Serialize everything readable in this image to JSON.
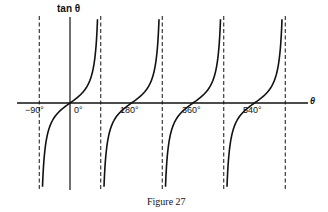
{
  "figure": {
    "y_axis_label": "tan θ",
    "x_axis_label": "θ",
    "caption": "Figure 27",
    "tick_labels": [
      "−90°",
      "0°",
      "180°",
      "360°",
      "540°"
    ],
    "line_color": "#111111"
  },
  "chart_data": {
    "type": "line",
    "title": "",
    "xlabel": "θ",
    "ylabel": "tan θ",
    "function": "tan(θ)",
    "xlim_deg": [
      -110,
      650
    ],
    "x_ticks_deg": [
      -90,
      0,
      180,
      360,
      540
    ],
    "x_tick_labels": [
      "−90°",
      "0°",
      "180°",
      "360°",
      "540°"
    ],
    "asymptotes_deg": [
      -90,
      90,
      270,
      450,
      630
    ],
    "asymptote_style": "dashed",
    "grid": false,
    "legend": null,
    "caption": "Figure 27",
    "branches": [
      {
        "from_deg": -90,
        "to_deg": 90,
        "zero_crossing_deg": 0
      },
      {
        "from_deg": 90,
        "to_deg": 270,
        "zero_crossing_deg": 180
      },
      {
        "from_deg": 270,
        "to_deg": 450,
        "zero_crossing_deg": 360
      },
      {
        "from_deg": 450,
        "to_deg": 630,
        "zero_crossing_deg": 540
      }
    ]
  }
}
